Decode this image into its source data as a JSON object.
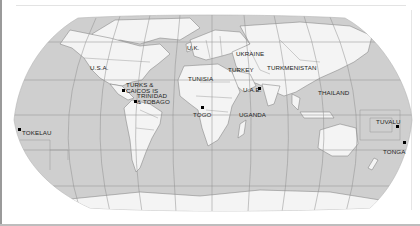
{
  "map": {
    "type": "world-map",
    "projection": "Robinson (approximate)",
    "colors": {
      "ocean": "#cfcfcf",
      "land": "#f4f4f4",
      "graticule": "#8f8f8f",
      "borders": "#7a7a7a",
      "label": "#222222",
      "marker": "#000000"
    },
    "labels": [
      {
        "id": "usa",
        "text": "U.S.A.",
        "marked": false
      },
      {
        "id": "uk",
        "text": "U.K.",
        "marked": false
      },
      {
        "id": "ukraine",
        "text": "UKRAINE",
        "marked": false
      },
      {
        "id": "turkey",
        "text": "TURKEY",
        "marked": false
      },
      {
        "id": "turkmenistan",
        "text": "TURKMENISTAN",
        "marked": false
      },
      {
        "id": "tunisia",
        "text": "TUNISIA",
        "marked": false
      },
      {
        "id": "turks_caicos_1",
        "text": "TURKS &",
        "marked": true
      },
      {
        "id": "turks_caicos_2",
        "text": "CAICOS IS",
        "marked": true
      },
      {
        "id": "trinidad_1",
        "text": "TRINIDAD",
        "marked": true
      },
      {
        "id": "trinidad_2",
        "text": "& TOBAGO",
        "marked": true
      },
      {
        "id": "uae",
        "text": "U.A.E.",
        "marked": true
      },
      {
        "id": "thailand",
        "text": "THAILAND",
        "marked": false
      },
      {
        "id": "togo",
        "text": "TOGO",
        "marked": true
      },
      {
        "id": "uganda",
        "text": "UGANDA",
        "marked": false
      },
      {
        "id": "tokelau",
        "text": "TOKELAU",
        "marked": true
      },
      {
        "id": "tuvalu",
        "text": "TUVALU",
        "marked": true
      },
      {
        "id": "tonga",
        "text": "TONGA",
        "marked": true
      }
    ]
  }
}
